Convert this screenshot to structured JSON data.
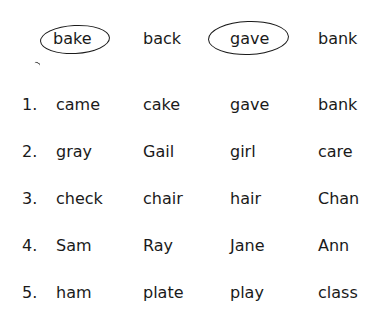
{
  "example": {
    "words": [
      "bake",
      "back",
      "gave",
      "bank"
    ],
    "circled": [
      0,
      2
    ]
  },
  "items": [
    {
      "number": "1.",
      "words": [
        "came",
        "cake",
        "gave",
        "bank"
      ]
    },
    {
      "number": "2.",
      "words": [
        "gray",
        "Gail",
        "girl",
        "care"
      ]
    },
    {
      "number": "3.",
      "words": [
        "check",
        "chair",
        "hair",
        "Chan"
      ]
    },
    {
      "number": "4.",
      "words": [
        "Sam",
        "Ray",
        "Jane",
        "Ann"
      ]
    },
    {
      "number": "5.",
      "words": [
        "ham",
        "plate",
        "play",
        "class"
      ]
    }
  ]
}
